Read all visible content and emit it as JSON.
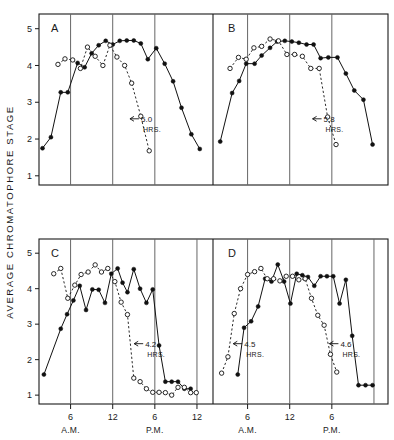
{
  "figure": {
    "ylabel": "AVERAGE CHROMATOPHORE STAGE",
    "panels": [
      "A",
      "B",
      "C",
      "D"
    ]
  },
  "axes": {
    "y_ticks": [
      "1",
      "2",
      "3",
      "4",
      "5"
    ],
    "y_tick_values": [
      1,
      2,
      3,
      4,
      5
    ],
    "ylim": [
      0.75,
      5.4
    ],
    "x_ticks_top": [
      "6",
      "12",
      "6"
    ],
    "x_ticks_bottom": [
      "6",
      "12",
      "6",
      "12",
      "6",
      "12",
      "6"
    ],
    "x_periods": [
      "A.M.",
      "P.M.",
      "A.M.",
      "P.M."
    ],
    "xlim": [
      0,
      30
    ]
  },
  "annotations": {
    "A": {
      "value": "5.0",
      "unit": "HRS."
    },
    "B": {
      "value": "5.8",
      "unit": "HRS."
    },
    "C": {
      "value": "4.2",
      "unit": "HRS."
    },
    "D1": {
      "value": "4.5",
      "unit": "HRS."
    },
    "D2": {
      "value": "4.6",
      "unit": "HRS."
    }
  },
  "chart_data": {
    "type": "line",
    "title": "",
    "xlabel": "",
    "ylabel": "AVERAGE CHROMATOPHORE STAGE",
    "ylim": [
      0.75,
      5.4
    ],
    "grid": false,
    "legend": false,
    "series_styles": {
      "solid": "filled circles, solid line",
      "dashed": "open circles, dashed line"
    },
    "panels": [
      {
        "name": "A",
        "xlim": [
          1.5,
          26
        ],
        "x_gridlines": [
          6,
          12,
          18
        ],
        "series": [
          {
            "name": "solid",
            "marker": "filled",
            "x": [
              2.0,
              3.2,
              4.6,
              5.6,
              7.0,
              8.0,
              9.0,
              10.0,
              11.0,
              12.0,
              13.0,
              14.0,
              15.0,
              16.0,
              17.0,
              18.2,
              19.4,
              20.6,
              21.8,
              23.2,
              24.4
            ],
            "y": [
              1.75,
              2.05,
              3.27,
              3.27,
              4.07,
              3.95,
              4.33,
              4.55,
              4.67,
              4.57,
              4.67,
              4.68,
              4.68,
              4.6,
              4.17,
              4.47,
              4.05,
              3.57,
              2.85,
              2.13,
              1.73
            ]
          },
          {
            "name": "dashed",
            "marker": "open",
            "x": [
              4.2,
              5.2,
              6.3,
              7.4,
              8.4,
              9.5,
              10.6,
              11.6,
              12.6,
              13.7,
              14.7,
              16.0,
              17.2
            ],
            "y": [
              4.03,
              4.18,
              4.15,
              3.92,
              4.5,
              4.25,
              4.0,
              4.55,
              4.23,
              4.0,
              3.52,
              2.62,
              1.68
            ]
          }
        ],
        "annotation": {
          "label": "5.0",
          "unit": "HRS.",
          "x": 14.6,
          "y": 2.55
        }
      },
      {
        "name": "B",
        "xlim": [
          1.5,
          26
        ],
        "x_gridlines": [
          6,
          12,
          18
        ],
        "series": [
          {
            "name": "solid",
            "marker": "filled",
            "x": [
              2.1,
              3.8,
              4.8,
              5.8,
              7.0,
              8.0,
              9.2,
              10.2,
              11.3,
              12.3,
              13.3,
              14.4,
              15.4,
              16.4,
              17.5,
              18.8,
              20.0,
              21.2,
              22.5,
              23.8
            ],
            "y": [
              1.93,
              3.25,
              3.58,
              4.05,
              4.05,
              4.27,
              4.48,
              4.65,
              4.67,
              4.65,
              4.62,
              4.57,
              4.57,
              4.2,
              4.22,
              4.22,
              3.78,
              3.32,
              3.07,
              1.85
            ]
          },
          {
            "name": "dashed",
            "marker": "open",
            "x": [
              3.5,
              4.7,
              5.8,
              6.9,
              8.0,
              9.2,
              10.4,
              11.6,
              12.7,
              13.8,
              15.0,
              16.2,
              17.4,
              18.6
            ],
            "y": [
              3.92,
              4.22,
              4.17,
              4.48,
              4.52,
              4.72,
              4.67,
              4.3,
              4.3,
              4.25,
              3.92,
              3.92,
              2.6,
              1.85
            ]
          }
        ],
        "annotation": {
          "label": "5.8",
          "unit": "HRS.",
          "x": 15.4,
          "y": 2.55
        }
      },
      {
        "name": "C",
        "xlim": [
          1.5,
          26
        ],
        "x_gridlines": [
          6,
          12,
          18,
          24
        ],
        "series": [
          {
            "name": "solid",
            "marker": "filled",
            "x": [
              2.2,
              4.6,
              5.5,
              6.4,
              7.3,
              8.2,
              9.1,
              10.0,
              10.9,
              11.8,
              12.7,
              13.4,
              14.1,
              15.0,
              15.9,
              16.8,
              17.7,
              18.6,
              19.5,
              20.4,
              21.3,
              22.2,
              23.1
            ],
            "y": [
              1.58,
              2.87,
              3.28,
              3.67,
              4.08,
              3.4,
              3.98,
              3.97,
              3.6,
              4.42,
              4.57,
              4.17,
              3.9,
              4.55,
              4.0,
              3.6,
              3.98,
              2.4,
              1.38,
              1.38,
              1.38,
              1.18,
              1.18
            ]
          },
          {
            "name": "dashed",
            "marker": "open",
            "x": [
              3.6,
              4.6,
              5.6,
              6.6,
              7.5,
              8.5,
              9.5,
              10.4,
              11.3,
              12.3,
              13.2,
              14.1,
              15.0,
              15.9,
              16.8,
              17.7,
              18.6,
              19.5,
              20.4,
              21.3,
              22.2,
              23.1,
              23.9
            ],
            "y": [
              4.42,
              4.57,
              3.73,
              4.1,
              4.4,
              4.47,
              4.67,
              4.47,
              4.57,
              4.2,
              3.62,
              3.27,
              1.48,
              1.38,
              1.18,
              1.08,
              1.08,
              1.07,
              1.0,
              1.22,
              1.22,
              1.07,
              1.07
            ]
          }
        ],
        "annotation": {
          "label": "4.2",
          "unit": "HRS.",
          "x": 15.2,
          "y": 2.45
        }
      },
      {
        "name": "D",
        "xlim": [
          1.5,
          26
        ],
        "x_gridlines": [
          6,
          12,
          18,
          24
        ],
        "series": [
          {
            "name": "solid",
            "marker": "filled",
            "x": [
              4.6,
              5.5,
              6.5,
              7.5,
              8.5,
              9.4,
              10.3,
              11.2,
              12.1,
              13.0,
              13.8,
              14.6,
              15.5,
              16.4,
              17.3,
              18.2,
              19.1,
              20.0,
              20.9,
              21.8,
              22.8,
              23.8
            ],
            "y": [
              1.58,
              2.9,
              3.08,
              3.5,
              4.28,
              4.2,
              4.68,
              4.2,
              3.58,
              4.42,
              4.38,
              4.33,
              4.08,
              4.35,
              4.35,
              4.35,
              3.58,
              4.25,
              2.67,
              1.28,
              1.28,
              1.28
            ]
          },
          {
            "name": "dashed",
            "marker": "open",
            "x": [
              2.3,
              3.2,
              4.1,
              5.0,
              6.0,
              7.0,
              7.9,
              8.8,
              9.7,
              10.6,
              11.5,
              12.4,
              13.3,
              14.2,
              15.1,
              16.0,
              16.9,
              17.8,
              18.7
            ],
            "y": [
              1.62,
              2.08,
              3.3,
              4.0,
              4.4,
              4.48,
              4.57,
              4.28,
              4.28,
              4.22,
              4.35,
              4.35,
              4.25,
              4.28,
              3.73,
              3.25,
              2.97,
              2.15,
              1.65
            ]
          }
        ],
        "annotation1": {
          "label": "4.5",
          "unit": "HRS.",
          "x": 4.1,
          "y": 2.45
        },
        "annotation2": {
          "label": "4.6",
          "unit": "HRS.",
          "x": 17.8,
          "y": 2.45
        }
      }
    ]
  }
}
